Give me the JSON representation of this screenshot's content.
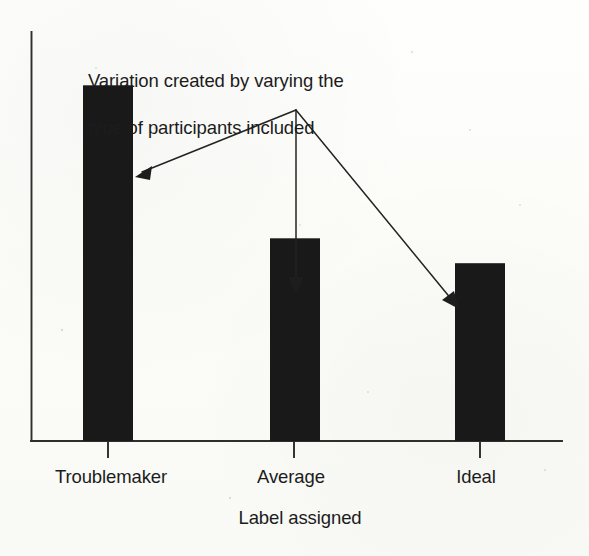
{
  "chart_data": {
    "type": "bar",
    "title": "",
    "xlabel": "Label assigned",
    "ylabel": "",
    "categories": [
      "Troublemaker",
      "Average",
      "Ideal"
    ],
    "values": [
      100,
      57,
      50
    ],
    "ylim": [
      0,
      115
    ],
    "grid": false,
    "legend": false,
    "bar_color": "#191919",
    "axis_color": "#2e2e2e",
    "background_color": "#fdfdfb",
    "annotations": [
      {
        "text": "Variation created by varying the\ntype of participants included",
        "points_to": [
          "Troublemaker",
          "Average",
          "Ideal"
        ]
      }
    ]
  },
  "annotation": {
    "line1": "Variation created by varying the",
    "line2": "type of participants included",
    "full": "Variation created by varying the\ntype of participants included"
  },
  "axis": {
    "x_title": "Label assigned",
    "tick_labels": [
      "Troublemaker",
      "Average",
      "Ideal"
    ]
  },
  "bars": [
    {
      "label": "Troublemaker",
      "value": 100
    },
    {
      "label": "Average",
      "value": 57
    },
    {
      "label": "Ideal",
      "value": 50
    }
  ]
}
